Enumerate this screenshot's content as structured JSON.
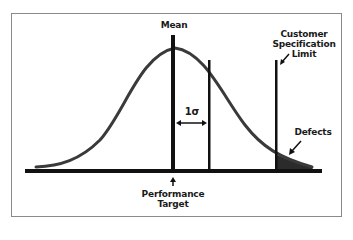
{
  "diagram": {
    "type": "normal-distribution",
    "labels": {
      "mean": "Mean",
      "sigma": "1σ",
      "spec_limit_line1": "Customer",
      "spec_limit_line2": "Specification",
      "spec_limit_line3": "Limit",
      "defects": "Defects",
      "target_line1": "Performance",
      "target_line2": "Target"
    },
    "colors": {
      "curve": "#3a3a3a",
      "lines": "#111111",
      "frame": "#8a8a8a",
      "defects_fill": "#2b2b2b"
    }
  }
}
